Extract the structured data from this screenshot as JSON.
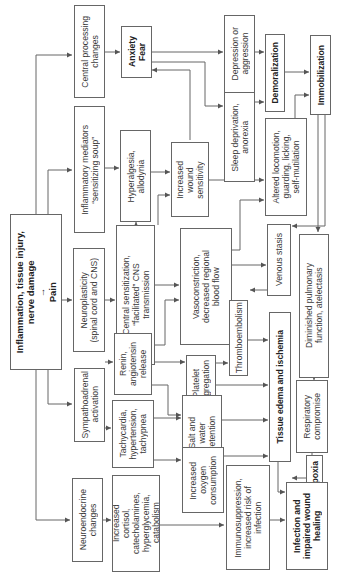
{
  "diagram": {
    "orientation": "rotated-90-ccw",
    "nodes": {
      "central_processing": "Central processing\nchanges",
      "anxiety_fear": "Anxiety\nFear",
      "depression": "Depression or\naggression",
      "demoralization": "Demoralization",
      "immobilization": "Immobilization",
      "inflammatory_mediators": "Inflammatory mediators\n“sensitizing soup”",
      "hyperalgesia": "Hyperalgesia,\nallodynia",
      "wound_sensitivity": "Increased\nwound\nsensitivity",
      "sleep_deprivation": "Sleep deprivation,\nanorexia",
      "altered_locomotion": "Altered locomotion,\nguarding, licking,\nself-mutilation",
      "root": "Inflammation, tissue injury,\nnerve damage\n→\nPain",
      "neuroplasticity": "Neuroplasticity\n(spinal cord and CNS)",
      "central_sensitization": "Central sensitization,\n“facilitated” CNS\ntransmission",
      "vasoconstriction": "Vasoconstriction,\ndecreased regional\nblood flow",
      "venous_stasis": "Venous stasis",
      "diminished_pulmonary": "Diminished pulmonary\nfunction, atelectasis",
      "sympathoadrenal": "Sympathoadrenal\nactivation",
      "renin": "Renin,\nangiotensin\nrelease",
      "platelet": "Platelet\naggregation",
      "thromboembolism": "Thromboembolism",
      "tissue_edema": "Tissue edema and ischemia",
      "respiratory": "Respiratory\ncompromise",
      "tachycardia": "Tachycardia,\nhypertension,\ntachypnea",
      "salt_water": "Salt and\nwater\nretention",
      "hypoxia": "Hypoxia",
      "neuroendocrine": "Neuroendocrine\nchanges",
      "cortisol": "Increased\ncortisol,\ncatecholamines,\nhyperglycemia,\ncatabolism",
      "oxygen_consumption": "Increased\noxygen\nconsumption",
      "immunosuppression": "Immunosuppression,\nincreased risk of\ninfection",
      "infection": "Infection and\nimpaired wound\nhealing"
    }
  }
}
